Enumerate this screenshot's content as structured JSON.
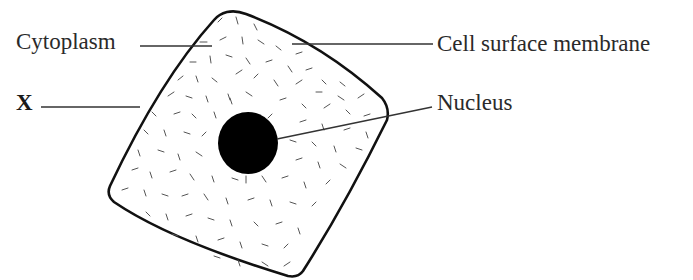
{
  "diagram": {
    "labels": {
      "cytoplasm": "Cytoplasm",
      "x": "X",
      "cell_surface_membrane": "Cell surface membrane",
      "nucleus": "Nucleus"
    },
    "colors": {
      "outline": "#111111",
      "nucleus": "#000000",
      "granules": "#555555",
      "leader_lines": "#333333",
      "text": "#2a2a2a",
      "background": "#ffffff"
    }
  }
}
